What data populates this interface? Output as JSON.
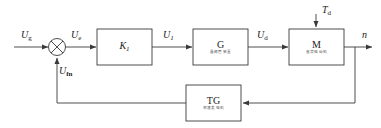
{
  "diagram": {
    "type": "control-block-diagram",
    "line_color": "#3a3a3a",
    "text_color": "#1a1a1a",
    "signals": {
      "input": {
        "symbol": "U",
        "subscript": "g",
        "text": "Ug"
      },
      "error": {
        "symbol": "U",
        "subscript": "e",
        "text": "Ue"
      },
      "after_k1": {
        "symbol": "U",
        "subscript": "1",
        "text": "U1"
      },
      "after_g": {
        "symbol": "U",
        "subscript": "d",
        "text": "Ud"
      },
      "disturbance": {
        "symbol": "T",
        "subscript": "d",
        "text": "Td"
      },
      "output": {
        "symbol": "n",
        "subscript": "",
        "text": "n"
      },
      "feedback": {
        "symbol": "U",
        "subscript": "fn",
        "text": "Ufn"
      }
    },
    "blocks": [
      {
        "id": "k1",
        "label": "K",
        "subscript": "1",
        "caption": ""
      },
      {
        "id": "g",
        "label": "G",
        "subscript": "",
        "caption": "晶闸管装置"
      },
      {
        "id": "m",
        "label": "M",
        "subscript": "",
        "caption": "直流电动机"
      },
      {
        "id": "tg",
        "label": "TG",
        "subscript": "",
        "caption": "测速发电机"
      }
    ],
    "summing_junction": {
      "name": "comparator",
      "style": "crossed-circle"
    }
  }
}
